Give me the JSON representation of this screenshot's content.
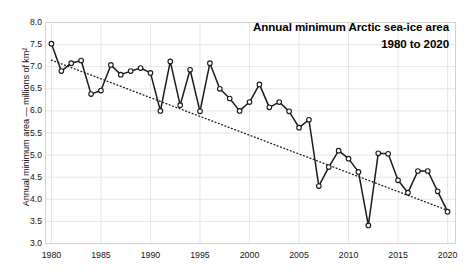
{
  "chart_data": {
    "type": "line",
    "title": "Annual minimum Arctic sea-ice area",
    "subtitle": "1980 to 2020",
    "xlabel": "",
    "ylabel": "Annual minimum area — millions of km²",
    "xlim": [
      1979.4,
      2020.8
    ],
    "ylim": [
      3.0,
      8.0
    ],
    "grid": true,
    "legend": "none",
    "y_ticks": [
      "3.0",
      "3.5",
      "4.0",
      "4.5",
      "5.0",
      "5.5",
      "6.0",
      "6.5",
      "7.0",
      "7.5",
      "8.0"
    ],
    "y_tick_values": [
      3.0,
      3.5,
      4.0,
      4.5,
      5.0,
      5.5,
      6.0,
      6.5,
      7.0,
      7.5,
      8.0
    ],
    "x_ticks": [
      "1980",
      "1985",
      "1990",
      "1995",
      "2000",
      "2005",
      "2010",
      "2015",
      "2020"
    ],
    "x_tick_values": [
      1980,
      1985,
      1990,
      1995,
      2000,
      2005,
      2010,
      2015,
      2020
    ],
    "marker": "open-circle",
    "line_color": "#1a1a1a",
    "marker_face_color": "#ffffff",
    "marker_edge_color": "#1a1a1a",
    "grid_color": "#e6e6e6",
    "x": [
      1980,
      1981,
      1982,
      1983,
      1984,
      1985,
      1986,
      1987,
      1988,
      1989,
      1990,
      1991,
      1992,
      1993,
      1994,
      1995,
      1996,
      1997,
      1998,
      1999,
      2000,
      2001,
      2002,
      2003,
      2004,
      2005,
      2006,
      2007,
      2008,
      2009,
      2010,
      2011,
      2012,
      2013,
      2014,
      2015,
      2016,
      2017,
      2018,
      2019,
      2020
    ],
    "series": [
      {
        "name": "Annual minimum Arctic sea-ice area",
        "values": [
          7.52,
          6.9,
          7.08,
          7.14,
          6.38,
          6.46,
          7.04,
          6.82,
          6.9,
          6.97,
          6.86,
          6.0,
          7.12,
          6.13,
          6.93,
          5.99,
          7.08,
          6.5,
          6.28,
          6.0,
          6.2,
          6.6,
          6.08,
          6.2,
          5.99,
          5.62,
          5.8,
          4.3,
          4.73,
          5.1,
          4.92,
          4.62,
          3.41,
          5.04,
          5.03,
          4.43,
          4.15,
          4.64,
          4.64,
          4.18,
          3.72
        ]
      },
      {
        "name": "linear trend",
        "type": "trendline",
        "style": "dotted",
        "endpoints": [
          {
            "x": 1980,
            "y": 7.15
          },
          {
            "x": 2020,
            "y": 3.75
          }
        ]
      }
    ]
  },
  "axes": {
    "y_axis_title": "Annual minimum area — millions of km²"
  },
  "header": {
    "title_line1": "Annual minimum Arctic sea-ice area",
    "title_line2": "1980 to 2020"
  }
}
